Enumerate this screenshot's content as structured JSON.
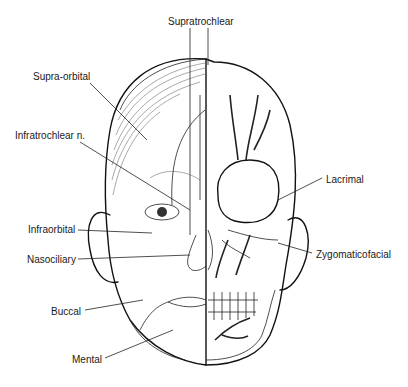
{
  "diagram": {
    "type": "anatomical-illustration",
    "labels": [
      {
        "id": "supratrochlear",
        "text": "Supratrochlear",
        "x": 168,
        "y": 16
      },
      {
        "id": "supra-orbital",
        "text": "Supra-orbital",
        "x": 33,
        "y": 71
      },
      {
        "id": "infratrochlear",
        "text": "Infratrochlear n.",
        "x": 15,
        "y": 130
      },
      {
        "id": "lacrimal",
        "text": "Lacrimal",
        "x": 326,
        "y": 174
      },
      {
        "id": "infraorbital",
        "text": "Infraorbital",
        "x": 28,
        "y": 224
      },
      {
        "id": "nasociliary",
        "text": "Nasociliary",
        "x": 27,
        "y": 254
      },
      {
        "id": "zygomaticofacial",
        "text": "Zygomaticofacial",
        "x": 316,
        "y": 249
      },
      {
        "id": "buccal",
        "text": "Buccal",
        "x": 51,
        "y": 306
      },
      {
        "id": "mental",
        "text": "Mental",
        "x": 72,
        "y": 354
      }
    ],
    "colors": {
      "line": "#111111",
      "text": "#1a1a1a",
      "background": "#ffffff"
    }
  }
}
